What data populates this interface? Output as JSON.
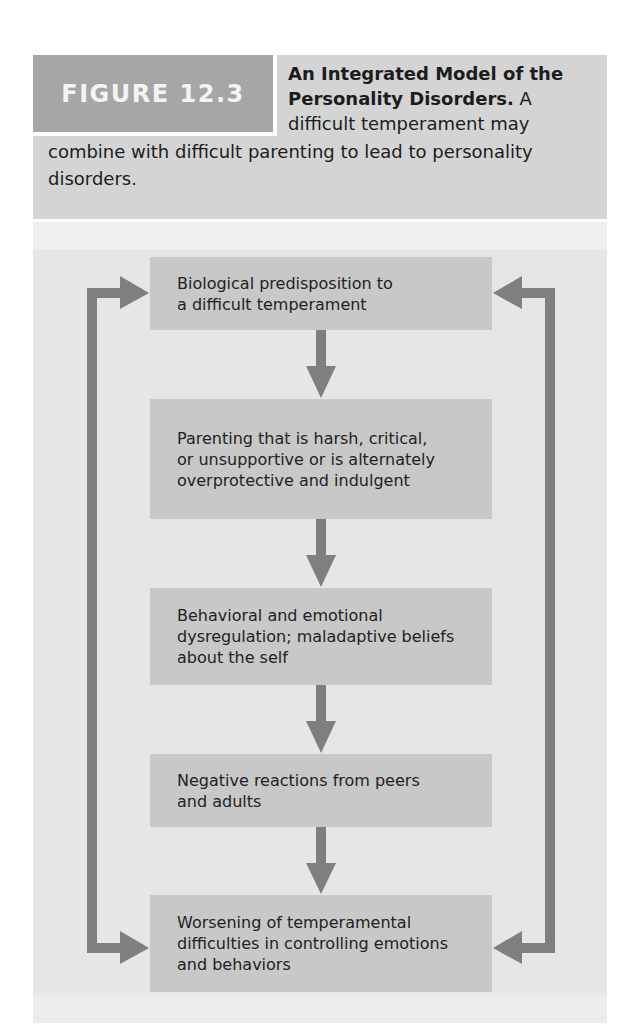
{
  "figure": {
    "label": "FIGURE 12.3",
    "caption": {
      "title": "An Integrated Model of the Personality Disorders.",
      "title_line1": "An Integrated Model of the",
      "title_line2": "Personality Disorders.",
      "body_lead": " A",
      "body_line3": "difficult temperament may",
      "body_line4": "combine with difficult parenting to lead to personality",
      "body_line5": "disorders.",
      "body_full": "A difficult temperament may combine with difficult parenting to lead to personality disorders."
    }
  },
  "diagram": {
    "type": "flowchart",
    "nodes": [
      {
        "id": "n1",
        "lines": [
          "Biological predisposition to",
          "a difficult temperament"
        ]
      },
      {
        "id": "n2",
        "lines": [
          "Parenting that is harsh, critical,",
          "or unsupportive or is alternately",
          "overprotective and indulgent"
        ]
      },
      {
        "id": "n3",
        "lines": [
          "Behavioral and emotional",
          "dysregulation; maladaptive beliefs",
          "about the self"
        ]
      },
      {
        "id": "n4",
        "lines": [
          "Negative reactions from peers",
          "and adults"
        ]
      },
      {
        "id": "n5",
        "lines": [
          "Worsening of temperamental",
          "difficulties in controlling emotions",
          "and behaviors"
        ]
      }
    ],
    "edges": [
      {
        "from": "n1",
        "to": "n2",
        "kind": "down-arrow"
      },
      {
        "from": "n2",
        "to": "n3",
        "kind": "down-arrow"
      },
      {
        "from": "n3",
        "to": "n4",
        "kind": "down-arrow"
      },
      {
        "from": "n4",
        "to": "n5",
        "kind": "down-arrow"
      },
      {
        "from": "n5",
        "to": "n1",
        "kind": "feedback-loop-left",
        "bidirectional": true
      },
      {
        "from": "n5",
        "to": "n1",
        "kind": "feedback-loop-right",
        "bidirectional": true
      }
    ]
  },
  "colors": {
    "label_bg": "#a6a6a6",
    "caption_bg": "#d4d4d4",
    "diagram_bg": "#e6e6e6",
    "node_bg": "#c8c8c8",
    "arrow": "#7f7f7f",
    "text": "#222222"
  }
}
